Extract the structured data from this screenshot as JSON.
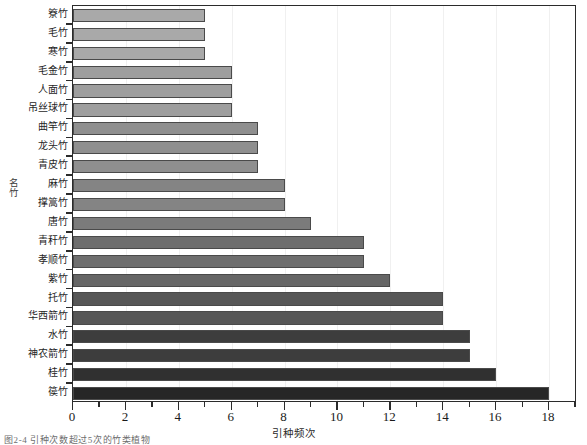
{
  "chart_data": {
    "type": "bar",
    "orientation": "horizontal",
    "title": "",
    "xlabel": "引种频次",
    "ylabel": "名竹",
    "xlim": [
      0,
      19
    ],
    "ylim": [
      0,
      20
    ],
    "grid": true,
    "legend": null,
    "xticks": [
      0,
      2,
      4,
      6,
      8,
      10,
      12,
      14,
      16,
      18
    ],
    "xtick_labels": [
      "0",
      "2",
      "4",
      "6",
      "8",
      "10",
      "12",
      "14",
      "16",
      "18"
    ],
    "minor_tick_step": 1,
    "categories": [
      "簝竹",
      "毛竹",
      "寒竹",
      "毛金竹",
      "人面竹",
      "吊丝球竹",
      "曲竿竹",
      "龙头竹",
      "青皮竹",
      "麻竹",
      "撑篙竹",
      "唐竹",
      "青秆竹",
      "孝顺竹",
      "紫竹",
      "托竹",
      "华西箭竹",
      "水竹",
      "神农箭竹",
      "桂竹",
      "篌竹"
    ],
    "values": [
      5,
      5,
      5,
      6,
      6,
      6,
      7,
      7,
      7,
      8,
      8,
      9,
      11,
      11,
      12,
      14,
      14,
      15,
      15,
      16,
      18
    ],
    "bar_colors": [
      "#a9a9a9",
      "#a9a9a9",
      "#a9a9a9",
      "#9e9e9e",
      "#9e9e9e",
      "#9e9e9e",
      "#8f8f8f",
      "#8f8f8f",
      "#8f8f8f",
      "#848484",
      "#848484",
      "#7b7b7b",
      "#6e6e6e",
      "#6e6e6e",
      "#666666",
      "#575757",
      "#575757",
      "#3d3d3d",
      "#3d3d3d",
      "#303030",
      "#262626"
    ]
  },
  "caption": "图2-4  引种次数超过5次的竹类植物"
}
